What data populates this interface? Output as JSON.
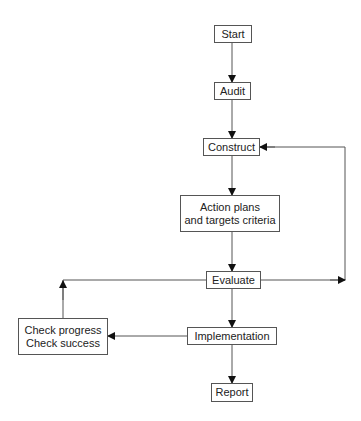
{
  "diagram": {
    "type": "flowchart",
    "nodes": {
      "start": {
        "label": "Start"
      },
      "audit": {
        "label": "Audit"
      },
      "construct": {
        "label": "Construct"
      },
      "action": {
        "line1": "Action plans",
        "line2": "and targets criteria"
      },
      "evaluate": {
        "label": "Evaluate"
      },
      "implementation": {
        "label": "Implementation"
      },
      "check": {
        "line1": "Check progress",
        "line2": "Check success"
      },
      "report": {
        "label": "Report"
      }
    },
    "edges": [
      {
        "from": "Start",
        "to": "Audit"
      },
      {
        "from": "Audit",
        "to": "Construct"
      },
      {
        "from": "Construct",
        "to": "Action plans and targets criteria"
      },
      {
        "from": "Action plans and targets criteria",
        "to": "Evaluate"
      },
      {
        "from": "Evaluate",
        "to": "Construct",
        "route": "right loop"
      },
      {
        "from": "Evaluate",
        "to": "Implementation"
      },
      {
        "from": "Implementation",
        "to": "Check progress / Check success"
      },
      {
        "from": "Check progress / Check success",
        "to": "Evaluate",
        "route": "left loop"
      },
      {
        "from": "Implementation",
        "to": "Report"
      }
    ],
    "colors": {
      "line": "#555555",
      "arrow": "#111111",
      "text": "#222222"
    }
  }
}
